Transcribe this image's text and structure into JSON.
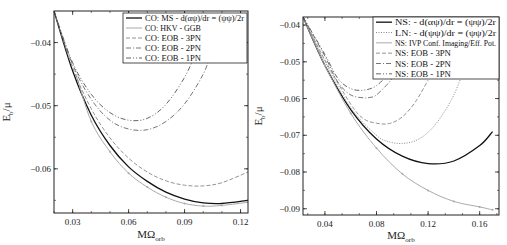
{
  "chart_data": [
    {
      "type": "line",
      "title": "",
      "xlabel": "MΩ_orb",
      "ylabel": "E_b/μ",
      "xlim": [
        0.02,
        0.124
      ],
      "ylim": [
        -0.067,
        -0.035
      ],
      "xticks": [
        "0.03",
        "0.06",
        "0.09",
        "0.12"
      ],
      "yticks": [
        "-0.04",
        "-0.05",
        "-0.06"
      ],
      "grid": false,
      "legend_position": "upper right",
      "series": [
        {
          "name": "CO: MS - d(αψ)/dr = (ψψ)/2r",
          "style": "solid-black",
          "x": [
            0.02,
            0.03,
            0.04,
            0.05,
            0.06,
            0.07,
            0.08,
            0.09,
            0.1,
            0.11,
            0.124
          ],
          "y": [
            -0.035,
            -0.0445,
            -0.0515,
            -0.0563,
            -0.0597,
            -0.062,
            -0.0637,
            -0.0648,
            -0.0654,
            -0.0655,
            -0.065
          ]
        },
        {
          "name": "CO: HKV - GGB",
          "style": "solid-gray-markers",
          "x": [
            0.032,
            0.04,
            0.05,
            0.06,
            0.07,
            0.08,
            0.09,
            0.1,
            0.11,
            0.124
          ],
          "y": [
            -0.0453,
            -0.0525,
            -0.0573,
            -0.0607,
            -0.0629,
            -0.0645,
            -0.0655,
            -0.0659,
            -0.0658,
            -0.0653
          ]
        },
        {
          "name": "CO: EOB - 3PN",
          "style": "dashed",
          "x": [
            0.02,
            0.03,
            0.04,
            0.05,
            0.06,
            0.07,
            0.08,
            0.09,
            0.1,
            0.11,
            0.124
          ],
          "y": [
            -0.035,
            -0.044,
            -0.0505,
            -0.0551,
            -0.0583,
            -0.0605,
            -0.0619,
            -0.0626,
            -0.0627,
            -0.0622,
            -0.0605
          ]
        },
        {
          "name": "CO: EOB - 2PN",
          "style": "dash-dot",
          "x": [
            0.02,
            0.03,
            0.04,
            0.05,
            0.06,
            0.07,
            0.08,
            0.09,
            0.1,
            0.105
          ],
          "y": [
            -0.035,
            -0.0435,
            -0.049,
            -0.0523,
            -0.0537,
            -0.0538,
            -0.0525,
            -0.0497,
            -0.045,
            -0.041
          ]
        },
        {
          "name": "CO: EOB - 1PN",
          "style": "dash-dot-dot",
          "x": [
            0.02,
            0.03,
            0.04,
            0.05,
            0.06,
            0.07,
            0.08,
            0.09,
            0.097
          ],
          "y": [
            -0.035,
            -0.0432,
            -0.0482,
            -0.0511,
            -0.0523,
            -0.052,
            -0.0498,
            -0.0455,
            -0.041
          ]
        }
      ]
    },
    {
      "type": "line",
      "title": "",
      "xlabel": "MΩ_orb",
      "ylabel": "E_b/μ",
      "xlim": [
        0.023,
        0.175
      ],
      "ylim": [
        -0.0917,
        -0.0378
      ],
      "xticks": [
        "0.04",
        "0.08",
        "0.12",
        "0.16"
      ],
      "yticks": [
        "-0.04",
        "-0.05",
        "-0.06",
        "-0.07",
        "-0.08",
        "-0.09"
      ],
      "grid": false,
      "legend_position": "upper right",
      "series": [
        {
          "name": "NS: - d(αψ)/dr = (ψψ)/2r",
          "style": "solid-black",
          "x": [
            0.023,
            0.04,
            0.06,
            0.08,
            0.1,
            0.12,
            0.14,
            0.16,
            0.17
          ],
          "y": [
            -0.0378,
            -0.051,
            -0.063,
            -0.071,
            -0.0757,
            -0.0777,
            -0.077,
            -0.0728,
            -0.069
          ]
        },
        {
          "name": "LN: - d(ψψ)/dr = (ψψ)/2r",
          "style": "dotted",
          "x": [
            0.023,
            0.04,
            0.06,
            0.08,
            0.09,
            0.1,
            0.11,
            0.12,
            0.13,
            0.14,
            0.148
          ],
          "y": [
            -0.0378,
            -0.05,
            -0.0625,
            -0.07,
            -0.0718,
            -0.0722,
            -0.0715,
            -0.0692,
            -0.065,
            -0.059,
            -0.052
          ]
        },
        {
          "name": "NS: IVP Conf. Imaging/Eff. Pot.",
          "style": "solid-gray-markers",
          "x": [
            0.023,
            0.04,
            0.06,
            0.08,
            0.1,
            0.12,
            0.14,
            0.16,
            0.17
          ],
          "y": [
            -0.0378,
            -0.051,
            -0.064,
            -0.0735,
            -0.0805,
            -0.085,
            -0.088,
            -0.0895,
            -0.0903
          ]
        },
        {
          "name": "NS: EOB - 3PN",
          "style": "dashed",
          "x": [
            0.023,
            0.04,
            0.06,
            0.07,
            0.08,
            0.09,
            0.1,
            0.11,
            0.12
          ],
          "y": [
            -0.0378,
            -0.0495,
            -0.0615,
            -0.0655,
            -0.0667,
            -0.0668,
            -0.065,
            -0.061,
            -0.055
          ]
        },
        {
          "name": "NS: EOB - 2PN",
          "style": "dash-dot",
          "x": [
            0.023,
            0.04,
            0.05,
            0.06,
            0.07,
            0.075,
            0.08,
            0.09,
            0.095
          ],
          "y": [
            -0.0378,
            -0.0485,
            -0.0555,
            -0.059,
            -0.0598,
            -0.0597,
            -0.059,
            -0.0555,
            -0.053
          ]
        },
        {
          "name": "NS: EOB - 1PN",
          "style": "dash-dot-dot",
          "x": [
            0.023,
            0.04,
            0.05,
            0.06,
            0.07,
            0.08,
            0.09
          ],
          "y": [
            -0.0378,
            -0.048,
            -0.0545,
            -0.0573,
            -0.0577,
            -0.0565,
            -0.053
          ]
        }
      ]
    }
  ]
}
